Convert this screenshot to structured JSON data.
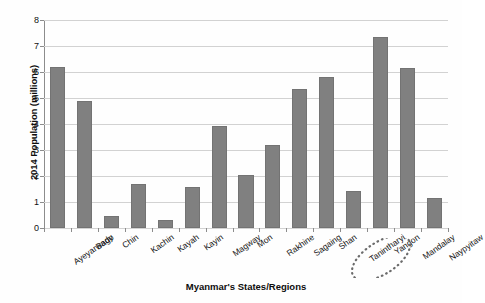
{
  "chart_data": {
    "type": "bar",
    "title": "",
    "xlabel": "Myanmar's States/Regions",
    "ylabel": "2014 Population (millions)",
    "categories": [
      "Ayeyarwady",
      "Bago",
      "Chin",
      "Kachin",
      "Kayah",
      "Kayin",
      "Magway",
      "Mon",
      "Rakhine",
      "Sagaing",
      "Shan",
      "Tanintharyi",
      "Yangon",
      "Mandalay",
      "Naypyitaw"
    ],
    "values": [
      6.18,
      4.87,
      0.48,
      1.69,
      0.29,
      1.57,
      3.92,
      2.05,
      3.19,
      5.33,
      5.82,
      1.41,
      7.35,
      6.15,
      1.16
    ],
    "ylim": [
      0,
      8
    ],
    "ytick_labels": [
      "0",
      "1",
      "2",
      "3",
      "4",
      "5",
      "6",
      "7",
      "8"
    ],
    "ytick_values": [
      0,
      1,
      2,
      3,
      4,
      5,
      6,
      7,
      8
    ],
    "grid": true,
    "legend": "none",
    "bar_color": "#808080",
    "grid_color": "#d2d2d2",
    "axis_color": "#8c8c8c",
    "background_color": "#fefefe",
    "annotations": [
      {
        "name": "yangon-highlight",
        "shape": "dotted-ellipse",
        "target_category": "Yangon",
        "color": "#6b6b6b"
      }
    ]
  }
}
